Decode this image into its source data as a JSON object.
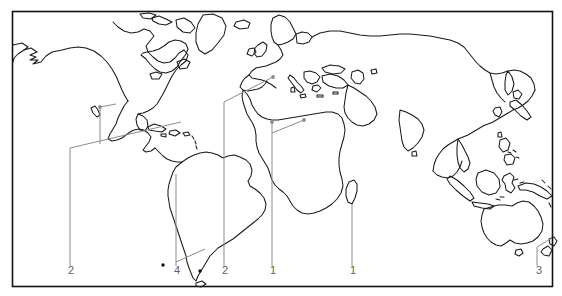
{
  "figure": {
    "type": "world-distribution-map",
    "frame": {
      "x": 12,
      "y": 11,
      "width": 541,
      "height": 276,
      "stroke": "#111111",
      "fill": "#ffffff"
    },
    "coastline_color": "#1a1a1a",
    "leader_color": "#8c8c8c",
    "label_color": "#5f5f5f"
  },
  "callouts": [
    {
      "id": "callout-mexico-caribbean",
      "label": "2",
      "label_x": 70,
      "label_y": 270,
      "anchor_region": "Mexico / Caribbean",
      "count": 2
    },
    {
      "id": "callout-central-america",
      "label": "4",
      "label_x": 176,
      "label_y": 270,
      "anchor_region": "Southern South America",
      "count": 4
    },
    {
      "id": "callout-iberia-mediterranean",
      "label": "2",
      "label_x": 224,
      "label_y": 270,
      "anchor_region": "Iberia / Mediterranean",
      "count": 2
    },
    {
      "id": "callout-west-africa",
      "label": "1",
      "label_x": 271,
      "label_y": 270,
      "anchor_region": "West Africa",
      "count": 1
    },
    {
      "id": "callout-madagascar",
      "label": "1",
      "label_x": 352,
      "label_y": 270,
      "anchor_region": "Madagascar",
      "count": 1
    },
    {
      "id": "callout-new-zealand",
      "label": "3",
      "label_x": 538,
      "label_y": 270,
      "anchor_region": "New Zealand",
      "count": 3
    }
  ],
  "markers": [
    {
      "id": "marker-mexico",
      "x": 100,
      "y": 107
    },
    {
      "id": "marker-iberia",
      "x": 273,
      "y": 77
    },
    {
      "id": "marker-west-africa",
      "x": 274,
      "y": 122
    },
    {
      "id": "marker-north-africa",
      "x": 304,
      "y": 120
    }
  ],
  "point_dots": [
    {
      "id": "dot-falklands",
      "x": 163,
      "y": 265
    },
    {
      "id": "dot-south-atlantic",
      "x": 200,
      "y": 271
    }
  ]
}
